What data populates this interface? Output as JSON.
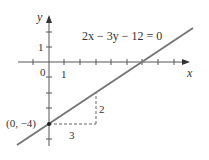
{
  "diagram": {
    "equation": "2x − 3y − 12 = 0",
    "axis_labels": {
      "x": "x",
      "y": "y"
    },
    "tick_labels": {
      "origin": "0",
      "x_one": "1",
      "y_one": "1"
    },
    "point_label": "(0, −4)",
    "run_label": "3",
    "rise_label": "2",
    "colors": {
      "line": "#777777",
      "axis": "#555555",
      "text": "#333333",
      "dash": "#666666"
    }
  }
}
